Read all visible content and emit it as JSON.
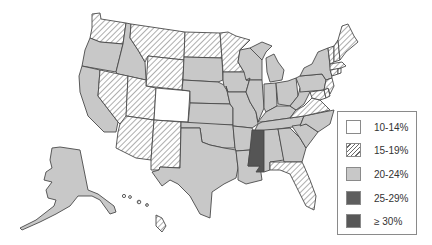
{
  "title": "",
  "colors": {
    "c10_14": "#ffffff",
    "c15_19": "hatch",
    "c20_24": "#c8c8c8",
    "c25_29": "#5e5e5e",
    "c30": "#5a5a5a",
    "stroke": "#4a4a4a"
  },
  "legend": {
    "items": [
      {
        "label": "10-14%",
        "fill": "white"
      },
      {
        "label": "15-19%",
        "fill": "hatch"
      },
      {
        "label": "20-24%",
        "fill": "light-gray"
      },
      {
        "label": "25-29%",
        "fill": "dark-gray"
      },
      {
        "label": "≥ 30%",
        "fill": "darker-gray"
      }
    ]
  },
  "states": {
    "10-14%": [
      "CO"
    ],
    "15-19%": [
      "WA",
      "MT",
      "ND",
      "MN",
      "WY",
      "NV",
      "UT",
      "AZ",
      "NM",
      "ME",
      "NH",
      "VT",
      "MA",
      "CT",
      "RI",
      "NJ",
      "DE",
      "MD",
      "VA",
      "FL",
      "HI"
    ],
    "20-24%": [
      "OR",
      "ID",
      "CA",
      "SD",
      "NE",
      "KS",
      "OK",
      "TX",
      "IA",
      "MO",
      "AR",
      "LA",
      "WI",
      "IL",
      "MI",
      "IN",
      "OH",
      "KY",
      "TN",
      "AL",
      "GA",
      "SC",
      "NC",
      "WV",
      "PA",
      "NY",
      "AK"
    ],
    "25-29%": [],
    "≥ 30%": [
      "MS"
    ]
  }
}
